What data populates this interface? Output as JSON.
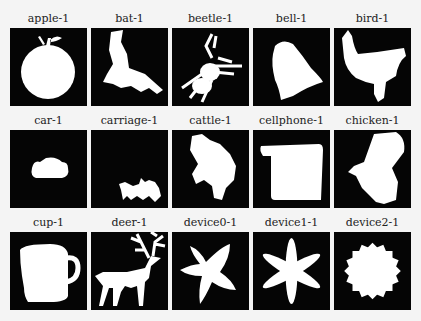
{
  "grid": {
    "rows": 3,
    "columns": 5,
    "items": [
      {
        "label": "apple-1"
      },
      {
        "label": "bat-1"
      },
      {
        "label": "beetle-1"
      },
      {
        "label": "bell-1"
      },
      {
        "label": "bird-1"
      },
      {
        "label": "car-1"
      },
      {
        "label": "carriage-1"
      },
      {
        "label": "cattle-1"
      },
      {
        "label": "cellphone-1"
      },
      {
        "label": "chicken-1"
      },
      {
        "label": "cup-1"
      },
      {
        "label": "deer-1"
      },
      {
        "label": "device0-1"
      },
      {
        "label": "device1-1"
      },
      {
        "label": "device2-1"
      }
    ]
  },
  "colors": {
    "background": "#f4f4f4",
    "silhouette": "#ffffff",
    "box": "#050505"
  }
}
